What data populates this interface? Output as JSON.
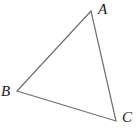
{
  "figure": {
    "kind": "geometry-diagram",
    "shape": "triangle",
    "background_color": "#ffffff",
    "stroke_color": "#6e6e6e",
    "stroke_width": 1.2,
    "label_color": "#1a1a1a",
    "canvas": {
      "width": 137,
      "height": 129
    }
  },
  "vertices": [
    {
      "id": "A",
      "label": "A",
      "x": 91,
      "y": 11,
      "label_x": 98,
      "label_y": 2
    },
    {
      "id": "B",
      "label": "B",
      "x": 17,
      "y": 91,
      "label_x": 1,
      "label_y": 84
    },
    {
      "id": "C",
      "label": "C",
      "x": 116,
      "y": 121,
      "label_x": 122,
      "label_y": 110
    }
  ],
  "edges": [
    {
      "id": "AB",
      "from": "A",
      "to": "B"
    },
    {
      "id": "BC",
      "from": "B",
      "to": "C"
    },
    {
      "id": "CA",
      "from": "C",
      "to": "A"
    }
  ],
  "polygon_points": "91,11 17,91 116,121"
}
